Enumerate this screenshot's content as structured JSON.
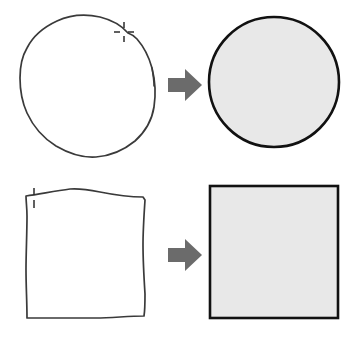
{
  "illustration": {
    "title": "Hand-drawn shape beautification",
    "background_color": "#ffffff",
    "width": 356,
    "height": 340,
    "rows": [
      {
        "id": "circle-row",
        "input_label": "hand-drawn circle sketch",
        "output_label": "recognized perfect circle",
        "arrow_label": "converts to"
      },
      {
        "id": "square-row",
        "input_label": "hand-drawn square sketch",
        "output_label": "recognized perfect square",
        "arrow_label": "converts to"
      }
    ],
    "colors": {
      "stroke": "#3a3a3a",
      "clean_stroke": "#111111",
      "clean_fill": "#e8e8e8",
      "arrow_fill": "#6b6b6b",
      "cursor": "#2b2b2b",
      "background": "#ffffff"
    },
    "cursors": [
      {
        "name": "crosshair-cursor",
        "shape": "plus",
        "x": 124,
        "y": 32
      },
      {
        "name": "caret-cursor",
        "shape": "vertical-tick",
        "x": 32,
        "y": 196
      }
    ]
  }
}
